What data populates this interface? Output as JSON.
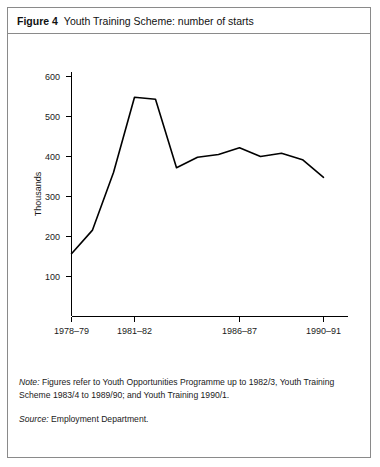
{
  "figure": {
    "label": "Figure 4",
    "title": "Youth Training Scheme: number of starts"
  },
  "notes": {
    "note_prefix": "Note:",
    "note_text": " Figures refer to Youth Opportunities Programme up to 1982/3, Youth Training Scheme 1983/4 to 1989/90; and Youth Training 1990/1.",
    "source_prefix": "Source:",
    "source_text": " Employment Department."
  },
  "chart_data": {
    "type": "line",
    "title": "Youth Training Scheme: number of starts",
    "xlabel": "",
    "ylabel": "Thousands",
    "ylim": [
      0,
      600
    ],
    "yticks": [
      100,
      200,
      300,
      400,
      500,
      600
    ],
    "ytick_labels": [
      "100",
      "200",
      "300",
      "400",
      "500",
      "600"
    ],
    "xlim": [
      0,
      13
    ],
    "xtick_labels": [
      "1978–79",
      "1981–82",
      "1986–87",
      "1990–91"
    ],
    "xtick_positions": [
      0,
      3,
      8,
      12
    ],
    "grid": false,
    "legend": null,
    "categories": [
      "1978–79",
      "1979–80",
      "1980–81",
      "1981–82",
      "1982–83",
      "1983–84",
      "1984–85",
      "1985–86",
      "1986–87",
      "1987–88",
      "1988–89",
      "1989–90",
      "1990–91"
    ],
    "values": [
      157,
      216,
      360,
      548,
      543,
      372,
      398,
      405,
      422,
      400,
      408,
      392,
      348
    ]
  }
}
